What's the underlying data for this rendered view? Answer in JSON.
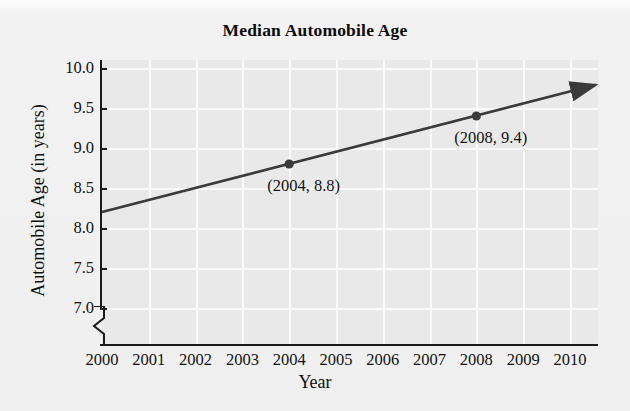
{
  "chart_data": {
    "type": "line",
    "title": "Median Automobile Age",
    "xlabel": "Year",
    "ylabel": "Automobile Age (in years)",
    "x": [
      2000,
      2001,
      2002,
      2003,
      2004,
      2005,
      2006,
      2007,
      2008,
      2009,
      2010
    ],
    "values": [
      8.2,
      8.35,
      8.5,
      8.65,
      8.8,
      8.95,
      9.1,
      9.25,
      9.4,
      9.55,
      9.7
    ],
    "xlim": [
      2000,
      2010.6
    ],
    "ylim": [
      7.0,
      10.0
    ],
    "xtick_labels": [
      "2000",
      "2001",
      "2002",
      "2003",
      "2004",
      "2005",
      "2006",
      "2007",
      "2008",
      "2009",
      "2010"
    ],
    "ytick_labels": [
      "10.0",
      "9.5",
      "9.0",
      "8.5",
      "8.0",
      "7.5",
      "7.0"
    ],
    "ytick_values": [
      10.0,
      9.5,
      9.0,
      8.5,
      8.0,
      7.5,
      7.0
    ],
    "grid": true,
    "legend": "none",
    "y_axis_break": true,
    "line_has_arrowhead": true,
    "line_color": "#3a3a3a",
    "marker_color": "#3a3a3a",
    "plot_background": "#e9e9e9",
    "gridline_color": "#fafafa",
    "axis_color": "#1a1a1a",
    "annotations": [
      {
        "label": "(2004, 8.8)",
        "x": 2004,
        "y": 8.8
      },
      {
        "label": "(2008, 9.4)",
        "x": 2008,
        "y": 9.4
      }
    ],
    "markers": [
      {
        "x": 2004,
        "y": 8.8
      },
      {
        "x": 2008,
        "y": 9.4
      }
    ]
  }
}
